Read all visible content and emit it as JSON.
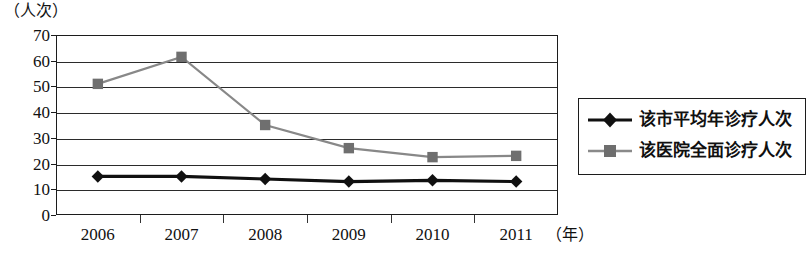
{
  "axes": {
    "y_unit_caption": "（人次）",
    "x_unit_caption": "（年）",
    "y_ticks": [
      "70",
      "60",
      "50",
      "40",
      "30",
      "20",
      "10",
      "0"
    ],
    "x_ticks": [
      "2006",
      "2007",
      "2008",
      "2009",
      "2010",
      "2011"
    ]
  },
  "legend": {
    "items": [
      {
        "label": "该市平均年诊疗人次",
        "marker": "diamond-marker",
        "color": "#101010"
      },
      {
        "label": "该医院全面诊疗人次",
        "marker": "square-marker",
        "color": "#888888"
      }
    ]
  },
  "chart_data": {
    "type": "line",
    "title": "",
    "subtitle": "",
    "xlabel": "（年）",
    "ylabel": "（人次）",
    "categories": [
      "2006",
      "2007",
      "2008",
      "2009",
      "2010",
      "2011"
    ],
    "ylim": [
      0,
      70
    ],
    "ytick_step": 10,
    "grid": true,
    "legend_position": "right",
    "series": [
      {
        "name": "该市平均年诊疗人次",
        "marker": "diamond",
        "color": "#101010",
        "values": [
          15,
          15,
          14,
          13,
          13.5,
          13
        ]
      },
      {
        "name": "该医院全面诊疗人次",
        "marker": "square",
        "color": "#888888",
        "values": [
          51,
          61.5,
          35,
          26,
          22.5,
          23
        ]
      }
    ]
  }
}
